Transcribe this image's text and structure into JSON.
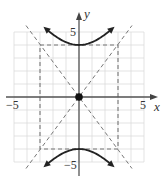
{
  "chart_data": {
    "type": "line",
    "title": "",
    "xlabel": "x",
    "ylabel": "y",
    "xlim": [
      -5.5,
      5.5
    ],
    "ylim": [
      -5.5,
      5.5
    ],
    "grid": true,
    "x_tick_labels": [
      "-5",
      "5"
    ],
    "y_tick_labels": [
      "5",
      "-5"
    ],
    "equation": "y^2/16 - x^2/9 = 1",
    "center": [
      0,
      0
    ],
    "vertices": [
      [
        0,
        4
      ],
      [
        0,
        -4
      ]
    ],
    "asymptotes": [
      "y = 4/3 x",
      "y = -4/3 x"
    ],
    "fundamental_rectangle": {
      "x": [
        -3,
        3
      ],
      "y": [
        -4,
        4
      ]
    },
    "series": [
      {
        "name": "upper branch",
        "style": "solid",
        "points": [
          [
            -2.5,
            5.2
          ],
          [
            -1.5,
            4.47
          ],
          [
            0,
            4
          ],
          [
            1.5,
            4.47
          ],
          [
            2.5,
            5.2
          ]
        ]
      },
      {
        "name": "lower branch",
        "style": "solid",
        "points": [
          [
            -2.5,
            -5.2
          ],
          [
            -1.5,
            -4.47
          ],
          [
            0,
            -4
          ],
          [
            1.5,
            -4.47
          ],
          [
            2.5,
            -5.2
          ]
        ]
      },
      {
        "name": "asymptote y=4x/3",
        "style": "dashed",
        "points": [
          [
            -4.1,
            -5.5
          ],
          [
            4.1,
            5.5
          ]
        ]
      },
      {
        "name": "asymptote y=-4x/3",
        "style": "dashed",
        "points": [
          [
            -4.1,
            5.5
          ],
          [
            4.1,
            -5.5
          ]
        ]
      }
    ],
    "annotations": [
      {
        "type": "point",
        "at": [
          0,
          0
        ],
        "label": "center"
      }
    ]
  },
  "labels": {
    "x_axis": "x",
    "y_axis": "y",
    "x_min": "−5",
    "x_max": "5",
    "y_max": "5",
    "y_min": "−5"
  },
  "colors": {
    "axis": "#555555",
    "grid": "#d9d9d9",
    "curve": "#222222",
    "dashed": "#777777"
  }
}
